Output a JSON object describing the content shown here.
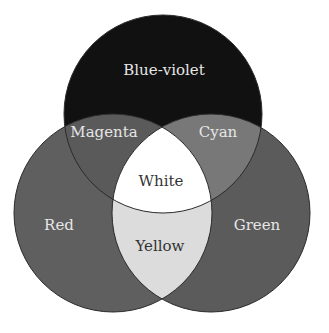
{
  "diagram": {
    "type": "venn-additive-color",
    "circles": [
      {
        "id": "blue-violet",
        "label": "Blue-violet",
        "cx": 163,
        "cy": 114,
        "r": 99,
        "fill": "#111111"
      },
      {
        "id": "red",
        "label": "Red",
        "cx": 113,
        "cy": 213,
        "r": 99,
        "fill": "#5f5f5f"
      },
      {
        "id": "green",
        "label": "Green",
        "cx": 211,
        "cy": 213,
        "r": 99,
        "fill": "#5b5b5b"
      }
    ],
    "overlaps": [
      {
        "id": "magenta",
        "label": "Magenta",
        "fill": "#5a5a5a"
      },
      {
        "id": "cyan",
        "label": "Cyan",
        "fill": "#787878"
      },
      {
        "id": "yellow",
        "label": "Yellow",
        "fill": "#dcdcdc"
      },
      {
        "id": "white",
        "label": "White",
        "fill": "#ffffff"
      }
    ],
    "labels": {
      "blue_violet": "Blue-violet",
      "magenta": "Magenta",
      "cyan": "Cyan",
      "white": "White",
      "red": "Red",
      "green": "Green",
      "yellow": "Yellow"
    },
    "label_colors": {
      "light": "#e6e6e6",
      "dark": "#333333"
    }
  }
}
